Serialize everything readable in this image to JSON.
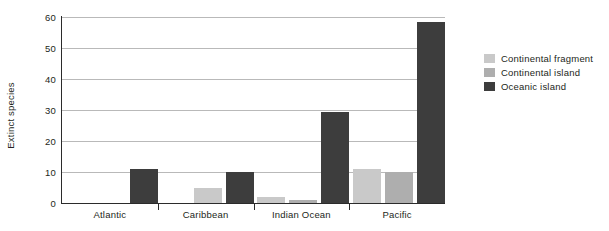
{
  "chart_data": {
    "type": "bar",
    "title": "",
    "xlabel": "",
    "ylabel": "Extinct species",
    "ylim": [
      0,
      60
    ],
    "yticks": [
      0,
      10,
      20,
      30,
      40,
      50,
      60
    ],
    "ytick_labels": [
      "0",
      "10",
      "20",
      "30",
      "40",
      "50",
      "60"
    ],
    "grid": true,
    "legend_position": "right",
    "categories": [
      "Atlantic",
      "Caribbean",
      "Indian Ocean",
      "Pacific"
    ],
    "series": [
      {
        "name": "Continental fragment",
        "color": "#c9c9c9",
        "values": [
          null,
          5,
          2,
          11
        ]
      },
      {
        "name": "Continental island",
        "color": "#aeaeae",
        "values": [
          null,
          null,
          1,
          10
        ]
      },
      {
        "name": "Oceanic island",
        "color": "#3d3d3d",
        "values": [
          11,
          10,
          29.5,
          58.5
        ]
      }
    ]
  },
  "legend": {
    "items": [
      {
        "label": "Continental fragment",
        "color": "#c9c9c9"
      },
      {
        "label": "Continental island",
        "color": "#aeaeae"
      },
      {
        "label": "Oceanic island",
        "color": "#3d3d3d"
      }
    ]
  },
  "colors": {
    "axis": "#2b2b2b",
    "gridline": "#b9b9b9",
    "text": "#231f20",
    "background": "#ffffff"
  }
}
